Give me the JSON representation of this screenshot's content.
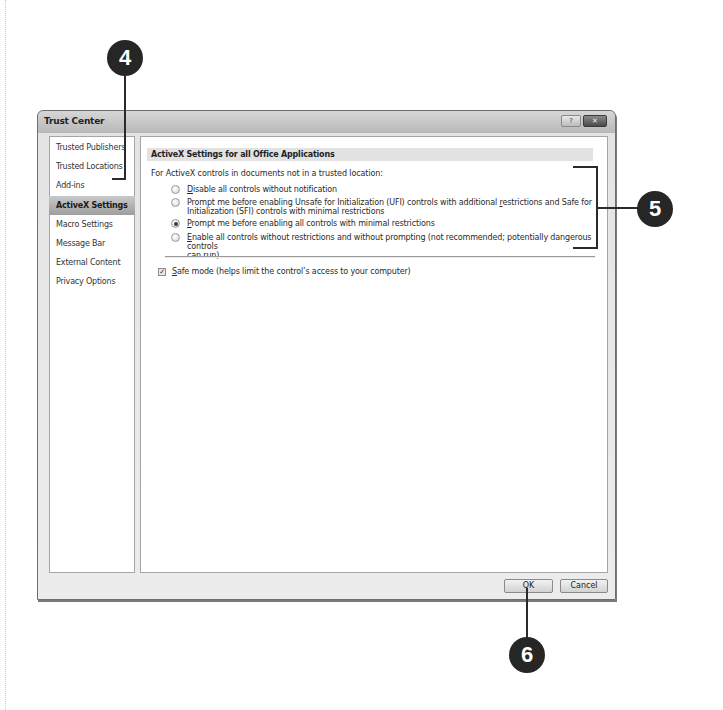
{
  "dialog": {
    "title": "Trust Center",
    "window_buttons": {
      "help": "?",
      "close": "✕"
    }
  },
  "sidebar": {
    "items": [
      {
        "label": "Trusted Publishers",
        "selected": false
      },
      {
        "label": "Trusted Locations",
        "selected": false
      },
      {
        "label": "Add-ins",
        "selected": false
      },
      {
        "label": "ActiveX Settings",
        "selected": true
      },
      {
        "label": "Macro Settings",
        "selected": false
      },
      {
        "label": "Message Bar",
        "selected": false
      },
      {
        "label": "External Content",
        "selected": false
      },
      {
        "label": "Privacy Options",
        "selected": false
      }
    ]
  },
  "content": {
    "section_header": "ActiveX Settings for all Office Applications",
    "intro": "For ActiveX controls in documents not in a trusted location:",
    "options": [
      {
        "accel": "D",
        "rest": "isable all controls without notification",
        "checked": false
      },
      {
        "line1": "Prompt me before enabling Unsafe for Initialization (UFI) controls with additional ",
        "accel": "r",
        "line1_rest": "estrictions and Safe for",
        "line2": "Initialization (SFI) controls with minimal restrictions",
        "checked": false
      },
      {
        "accel": "P",
        "rest": "rompt me before enabling all controls with minimal restrictions",
        "checked": true
      },
      {
        "accel": "E",
        "rest": "nable all controls without restrictions and without prompting (not recommended; potentially dangerous controls",
        "line2": "can run)",
        "checked": false
      }
    ],
    "safe_mode": {
      "accel": "S",
      "rest": "afe mode (helps limit the control’s access to your computer)",
      "checked": true
    }
  },
  "buttons": {
    "ok": "OK",
    "cancel": "Cancel"
  },
  "callouts": {
    "c4": "4",
    "c5": "5",
    "c6": "6"
  }
}
